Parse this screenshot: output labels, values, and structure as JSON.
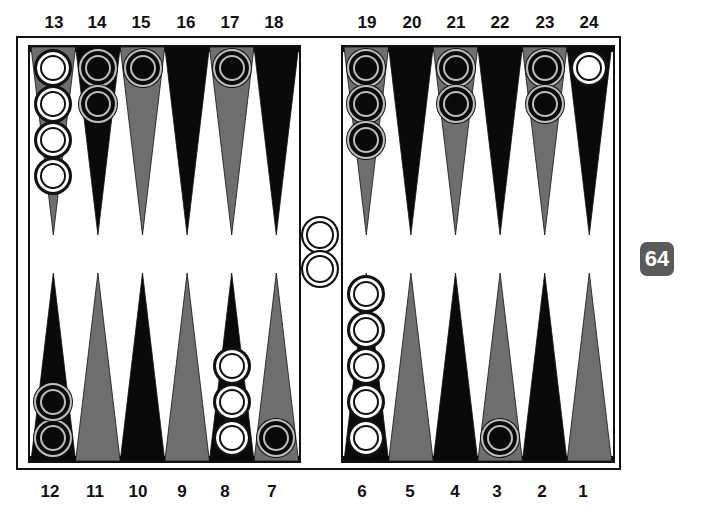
{
  "board": {
    "colors": {
      "frame": "#111111",
      "background": "#ffffff",
      "point_dark": "#0a0a0a",
      "point_gray": "#6e6e6e",
      "checker_white": "#ffffff",
      "checker_black": "#0a0a0a",
      "cube_bg": "#5a5a5a"
    },
    "top_labels": [
      "13",
      "14",
      "15",
      "16",
      "17",
      "18",
      "19",
      "20",
      "21",
      "22",
      "23",
      "24"
    ],
    "bottom_labels": [
      "12",
      "11",
      "10",
      "9",
      "8",
      "7",
      "6",
      "5",
      "4",
      "3",
      "2",
      "1"
    ],
    "points": [
      {
        "number": 1,
        "color": "gray",
        "checkers": 0,
        "owner": ""
      },
      {
        "number": 2,
        "color": "dark",
        "checkers": 0,
        "owner": ""
      },
      {
        "number": 3,
        "color": "gray",
        "checkers": 1,
        "owner": "black"
      },
      {
        "number": 4,
        "color": "dark",
        "checkers": 0,
        "owner": ""
      },
      {
        "number": 5,
        "color": "gray",
        "checkers": 0,
        "owner": ""
      },
      {
        "number": 6,
        "color": "dark",
        "checkers": 5,
        "owner": "white"
      },
      {
        "number": 7,
        "color": "gray",
        "checkers": 1,
        "owner": "black"
      },
      {
        "number": 8,
        "color": "dark",
        "checkers": 3,
        "owner": "white"
      },
      {
        "number": 9,
        "color": "gray",
        "checkers": 0,
        "owner": ""
      },
      {
        "number": 10,
        "color": "dark",
        "checkers": 0,
        "owner": ""
      },
      {
        "number": 11,
        "color": "gray",
        "checkers": 0,
        "owner": ""
      },
      {
        "number": 12,
        "color": "dark",
        "checkers": 2,
        "owner": "black"
      },
      {
        "number": 13,
        "color": "gray",
        "checkers": 4,
        "owner": "white"
      },
      {
        "number": 14,
        "color": "dark",
        "checkers": 2,
        "owner": "black"
      },
      {
        "number": 15,
        "color": "gray",
        "checkers": 1,
        "owner": "black"
      },
      {
        "number": 16,
        "color": "dark",
        "checkers": 0,
        "owner": ""
      },
      {
        "number": 17,
        "color": "gray",
        "checkers": 1,
        "owner": "black"
      },
      {
        "number": 18,
        "color": "dark",
        "checkers": 0,
        "owner": ""
      },
      {
        "number": 19,
        "color": "gray",
        "checkers": 3,
        "owner": "black"
      },
      {
        "number": 20,
        "color": "dark",
        "checkers": 0,
        "owner": ""
      },
      {
        "number": 21,
        "color": "gray",
        "checkers": 2,
        "owner": "black"
      },
      {
        "number": 22,
        "color": "dark",
        "checkers": 0,
        "owner": ""
      },
      {
        "number": 23,
        "color": "gray",
        "checkers": 2,
        "owner": "black"
      },
      {
        "number": 24,
        "color": "dark",
        "checkers": 1,
        "owner": "white"
      }
    ],
    "bar": {
      "white": 2,
      "black": 0
    },
    "cube": {
      "value": "64"
    }
  }
}
